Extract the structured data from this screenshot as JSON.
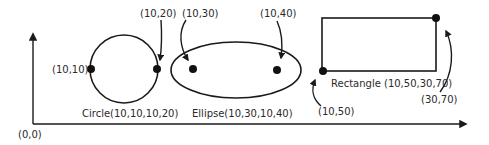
{
  "diagram": {
    "origin_label": "(0,0)",
    "circle": {
      "caption": "Circle(10,10,10,20)",
      "point_left_label": "(10,10)",
      "point_right_label": "(10,20)"
    },
    "ellipse": {
      "caption": "Ellipse(10,30,10,40)",
      "focus_left_label": "(10,30)",
      "focus_right_label": "(10,40)"
    },
    "rectangle": {
      "caption": "Rectangle (10,50,30,70)",
      "corner_bottom_left_label": "(10,50)",
      "corner_top_right_label": "(30,70)"
    },
    "colors": {
      "stroke": "#1a1a1a",
      "text": "#2a2a2a",
      "background": "#ffffff"
    }
  }
}
